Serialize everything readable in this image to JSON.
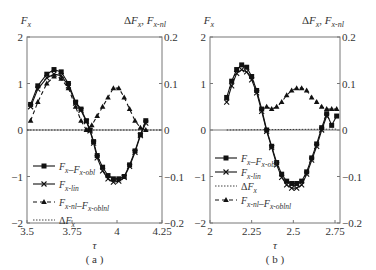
{
  "chart_data": [
    {
      "type": "line",
      "panel_label": "( a )",
      "xlabel": "τ",
      "ylabel_left": "F_x",
      "ylabel_right": "ΔF_x , F_x-nl",
      "xlim": [
        3.5,
        4.25
      ],
      "ylim_left": [
        -2,
        2
      ],
      "ylim_right": [
        -0.2,
        0.2
      ],
      "xticks": [
        "3.5",
        "3.75",
        "4",
        "4.25"
      ],
      "yticks_left": [
        "2",
        "1",
        "0",
        "-1",
        "-2"
      ],
      "yticks_right": [
        "0.2",
        "0.1",
        "0",
        "-0.1",
        "-0.2"
      ],
      "legend": [
        "F_x–F_x-obl",
        "F_x-lin",
        "F_x-nl–F_x-oblnl",
        "ΔF_x"
      ],
      "series": [
        {
          "name": "F_x–F_x-obl",
          "axis": "left",
          "marker": "square",
          "style": "solid",
          "x": [
            3.52,
            3.56,
            3.61,
            3.65,
            3.69,
            3.73,
            3.77,
            3.8,
            3.83,
            3.85,
            3.87,
            3.89,
            3.92,
            3.95,
            3.98,
            4.01,
            4.04,
            4.07,
            4.1,
            4.13,
            4.16
          ],
          "y": [
            0.55,
            0.95,
            1.2,
            1.3,
            1.25,
            1.0,
            0.6,
            0.45,
            0.2,
            0.0,
            -0.25,
            -0.55,
            -0.8,
            -0.98,
            -1.05,
            -1.05,
            -1.0,
            -0.75,
            -0.45,
            -0.1,
            0.2
          ]
        },
        {
          "name": "F_x-lin",
          "axis": "left",
          "marker": "x",
          "style": "solid",
          "x": [
            3.52,
            3.56,
            3.61,
            3.65,
            3.69,
            3.73,
            3.77,
            3.8,
            3.83,
            3.85,
            3.87,
            3.89,
            3.92,
            3.95,
            3.98,
            4.01,
            4.04,
            4.07,
            4.1,
            4.13,
            4.16
          ],
          "y": [
            0.5,
            0.88,
            1.12,
            1.2,
            1.17,
            0.95,
            0.58,
            0.42,
            0.18,
            -0.02,
            -0.28,
            -0.6,
            -0.88,
            -1.05,
            -1.12,
            -1.1,
            -1.02,
            -0.78,
            -0.48,
            -0.12,
            0.15
          ]
        },
        {
          "name": "F_x-nl–F_x-oblnl",
          "axis": "right",
          "marker": "triangle",
          "style": "dashed",
          "x": [
            3.52,
            3.56,
            3.61,
            3.65,
            3.69,
            3.73,
            3.77,
            3.8,
            3.83,
            3.86,
            3.89,
            3.92,
            3.95,
            3.98,
            4.01,
            4.04,
            4.07,
            4.1,
            4.13,
            4.16
          ],
          "y": [
            0.02,
            0.06,
            0.1,
            0.115,
            0.11,
            0.09,
            0.05,
            0.02,
            0.0,
            0.01,
            0.03,
            0.05,
            0.07,
            0.09,
            0.09,
            0.07,
            0.045,
            0.02,
            0.005,
            0.0
          ]
        },
        {
          "name": "ΔF_x",
          "axis": "right",
          "marker": "none",
          "style": "dotted",
          "x": [
            3.5,
            4.25
          ],
          "y": [
            0,
            0
          ]
        }
      ]
    },
    {
      "type": "line",
      "panel_label": "( b )",
      "xlabel": "τ",
      "ylabel_left": "F_x",
      "ylabel_right": "ΔF_x , F_x-nl",
      "xlim": [
        2,
        2.78
      ],
      "ylim_left": [
        -2,
        2
      ],
      "ylim_right": [
        -0.2,
        0.2
      ],
      "xticks": [
        "2",
        "2.25",
        "2.5",
        "2.75"
      ],
      "yticks_left": [
        "2",
        "1",
        "0",
        "-1",
        "-2"
      ],
      "yticks_right": [
        "0.2",
        "0.1",
        "0",
        "-0.1",
        "-0.2"
      ],
      "legend": [
        "F_x–F_x-obl",
        "F_x-lin",
        "ΔF_x",
        "F_x-nl–F_x-oblnl"
      ],
      "series": [
        {
          "name": "F_x–F_x-obl",
          "axis": "left",
          "marker": "square",
          "style": "solid",
          "x": [
            2.1,
            2.13,
            2.16,
            2.19,
            2.22,
            2.25,
            2.28,
            2.31,
            2.34,
            2.37,
            2.4,
            2.43,
            2.46,
            2.49,
            2.52,
            2.55,
            2.58,
            2.61,
            2.64,
            2.67,
            2.7,
            2.73,
            2.76
          ],
          "y": [
            0.7,
            1.05,
            1.3,
            1.4,
            1.35,
            1.15,
            0.85,
            0.45,
            0.0,
            -0.35,
            -0.7,
            -0.95,
            -1.1,
            -1.15,
            -1.15,
            -1.1,
            -0.9,
            -0.6,
            -0.3,
            0.05,
            0.35,
            0.1,
            0.3
          ]
        },
        {
          "name": "F_x-lin",
          "axis": "left",
          "marker": "x",
          "style": "solid",
          "x": [
            2.1,
            2.13,
            2.16,
            2.19,
            2.22,
            2.25,
            2.28,
            2.31,
            2.34,
            2.37,
            2.4,
            2.43,
            2.46,
            2.49,
            2.52,
            2.55,
            2.58,
            2.61,
            2.64,
            2.67,
            2.7
          ],
          "y": [
            0.6,
            0.95,
            1.22,
            1.3,
            1.25,
            1.08,
            0.8,
            0.4,
            -0.03,
            -0.38,
            -0.75,
            -1.02,
            -1.18,
            -1.25,
            -1.25,
            -1.18,
            -0.95,
            -0.65,
            -0.35,
            0.0,
            0.3
          ]
        },
        {
          "name": "ΔF_x",
          "axis": "right",
          "marker": "none",
          "style": "dotted",
          "x": [
            2.1,
            2.76
          ],
          "y": [
            0.0,
            0.002
          ]
        },
        {
          "name": "F_x-nl–F_x-oblnl",
          "axis": "right",
          "marker": "triangle",
          "style": "dashed",
          "x": [
            2.34,
            2.37,
            2.4,
            2.43,
            2.46,
            2.49,
            2.52,
            2.55,
            2.58,
            2.61,
            2.64,
            2.67,
            2.7,
            2.73,
            2.76
          ],
          "y": [
            0.05,
            0.045,
            0.05,
            0.06,
            0.075,
            0.085,
            0.09,
            0.09,
            0.085,
            0.07,
            0.06,
            0.05,
            0.045,
            0.045,
            0.045
          ]
        }
      ]
    }
  ]
}
